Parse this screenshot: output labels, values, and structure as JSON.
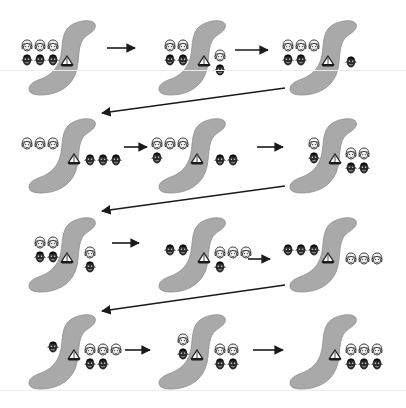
{
  "diagram": {
    "icons": {
      "missionary": "helmeted-face-icon",
      "cannibal": "dark-face-icon",
      "boat": "sailboat-icon",
      "river": "s-curve-river"
    },
    "colors": {
      "river": "#a9a9a9",
      "river_edge": "#8e8e8e",
      "arrow": "#1a1a1a",
      "face_dark": "#2b2b2b",
      "face_light": "#f2f2f2",
      "background": "#ffffff"
    },
    "states": [
      {
        "step": 1,
        "left": {
          "missionaries": 3,
          "cannibals": 3
        },
        "boat": "left",
        "right": {
          "missionaries": 0,
          "cannibals": 0
        }
      },
      {
        "step": 2,
        "left": {
          "missionaries": 2,
          "cannibals": 2
        },
        "boat": "right",
        "right": {
          "missionaries": 1,
          "cannibals": 1
        }
      },
      {
        "step": 3,
        "left": {
          "missionaries": 3,
          "cannibals": 2
        },
        "boat": "left",
        "right": {
          "missionaries": 0,
          "cannibals": 1
        }
      },
      {
        "step": 4,
        "left": {
          "missionaries": 3,
          "cannibals": 0
        },
        "boat": "right",
        "right": {
          "missionaries": 0,
          "cannibals": 3
        }
      },
      {
        "step": 5,
        "left": {
          "missionaries": 3,
          "cannibals": 1
        },
        "boat": "left",
        "right": {
          "missionaries": 0,
          "cannibals": 2
        }
      },
      {
        "step": 6,
        "left": {
          "missionaries": 1,
          "cannibals": 1
        },
        "boat": "right",
        "right": {
          "missionaries": 2,
          "cannibals": 2
        }
      },
      {
        "step": 7,
        "left": {
          "missionaries": 2,
          "cannibals": 2
        },
        "boat": "left",
        "right": {
          "missionaries": 1,
          "cannibals": 1
        }
      },
      {
        "step": 8,
        "left": {
          "missionaries": 0,
          "cannibals": 2
        },
        "boat": "right",
        "right": {
          "missionaries": 3,
          "cannibals": 1
        }
      },
      {
        "step": 9,
        "left": {
          "missionaries": 0,
          "cannibals": 3
        },
        "boat": "left",
        "right": {
          "missionaries": 3,
          "cannibals": 0
        }
      },
      {
        "step": 10,
        "left": {
          "missionaries": 0,
          "cannibals": 1
        },
        "boat": "right",
        "right": {
          "missionaries": 3,
          "cannibals": 2
        }
      },
      {
        "step": 11,
        "left": {
          "missionaries": 1,
          "cannibals": 1
        },
        "boat": "left",
        "right": {
          "missionaries": 2,
          "cannibals": 2
        }
      },
      {
        "step": 12,
        "left": {
          "missionaries": 0,
          "cannibals": 0
        },
        "boat": "right",
        "right": {
          "missionaries": 3,
          "cannibals": 3
        }
      }
    ],
    "layout": {
      "rows": 4,
      "columns": 3,
      "flow": "left-to-right, then diagonal back to next row"
    }
  }
}
